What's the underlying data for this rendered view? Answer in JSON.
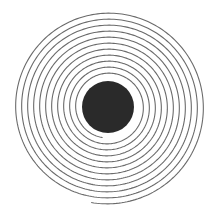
{
  "figure": {
    "type": "archimedean-spiral",
    "width": 216,
    "height": 215,
    "background": "#ffffff",
    "center": {
      "x": 108,
      "y": 107
    },
    "disc": {
      "radius": 26,
      "color": "#2a2a2a"
    },
    "spiral": {
      "stroke_color": "#6a6a6a",
      "stroke_width": 1.1,
      "inner_radius": 31,
      "outer_radius": 97,
      "turns": 11,
      "end_angle_deg": 100,
      "direction": "clockwise"
    }
  }
}
